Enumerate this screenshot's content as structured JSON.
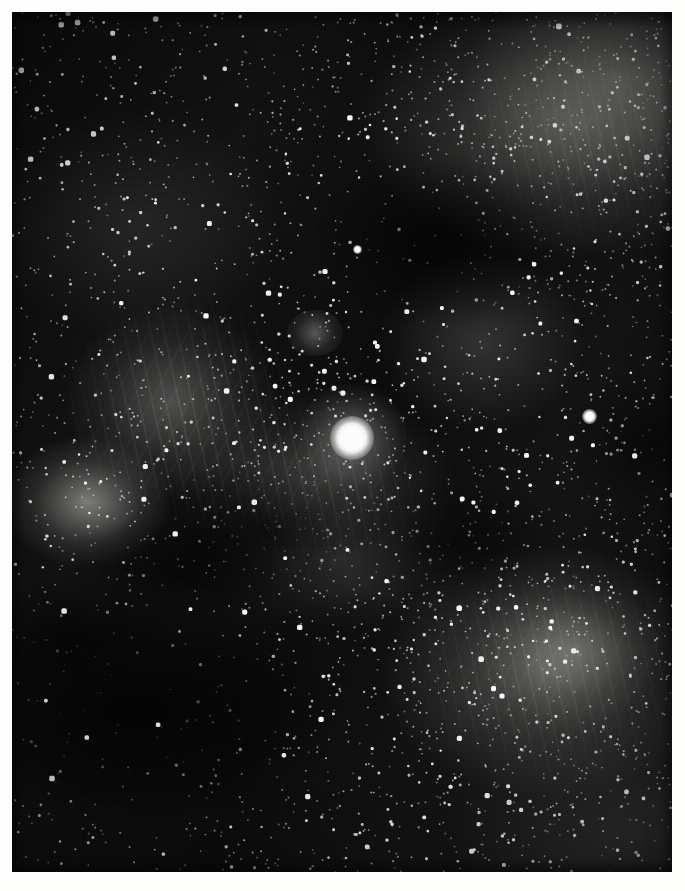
{
  "image": {
    "kind": "astrophotograph",
    "subject": "wide-field star cloud and emission nebula complex",
    "palette": "monochrome grayscale",
    "width_px": 685,
    "height_px": 891,
    "border_style": "white paper margin",
    "border_px": 12,
    "frame": {
      "x": 12,
      "y": 12,
      "width": 660,
      "height": 860
    },
    "background_color": "#0a0a0a",
    "paper_color": "#fdfdfb",
    "star_color": "#ffffff",
    "nebula_color": "#b4b4b0",
    "caption": "",
    "alt_text": "Dense monochrome star field with diffuse nebulosity and dark dust lanes, dominated by one very bright saturated star near the centre."
  },
  "features": [
    {
      "name": "dominant-bright-star",
      "label": "",
      "x": 340,
      "y": 438,
      "brightness": 1.0,
      "halo_px": 54
    },
    {
      "name": "secondary-bright-star",
      "label": "",
      "x": 583,
      "y": 410,
      "brightness": 0.72,
      "halo_px": 16
    },
    {
      "name": "upper-bright-star",
      "label": "",
      "x": 351,
      "y": 241,
      "brightness": 0.6,
      "halo_px": 10
    },
    {
      "name": "open-star-cluster",
      "label": "",
      "x": 305,
      "y": 322,
      "brightness": 0.55,
      "halo_px": 30
    },
    {
      "name": "crescent-nebula-patch",
      "label": "",
      "x": 87,
      "y": 502,
      "brightness": 0.62,
      "halo_px": 110
    },
    {
      "name": "upper-right-nebula",
      "label": "",
      "x": 572,
      "y": 122,
      "brightness": 0.58,
      "halo_px": 210
    },
    {
      "name": "lower-right-nebula-arc",
      "label": "",
      "x": 552,
      "y": 672,
      "brightness": 0.55,
      "halo_px": 220
    },
    {
      "name": "central-filament-complex",
      "label": "",
      "x": 312,
      "y": 492,
      "brightness": 0.42,
      "halo_px": 190
    },
    {
      "name": "lower-left-dark-lane",
      "label": "",
      "x": 132,
      "y": 712,
      "brightness": 0.05,
      "halo_px": 250
    },
    {
      "name": "upper-dark-lane",
      "label": "",
      "x": 442,
      "y": 242,
      "brightness": 0.08,
      "halo_px": 180
    }
  ],
  "star_field": {
    "density": "very high",
    "counts": {
      "faint": 2600,
      "medium": 620,
      "bright": 120
    },
    "note": "tens of thousands of Milky Way field stars"
  }
}
